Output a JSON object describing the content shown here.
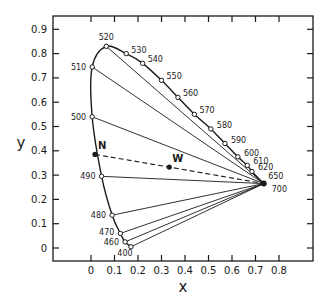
{
  "chart_data": {
    "type": "scatter",
    "title": "",
    "xlabel": "x",
    "ylabel": "y",
    "xlim": [
      -0.16,
      0.95
    ],
    "ylim": [
      -0.05,
      0.95
    ],
    "x_ticks": [
      "0",
      "0.1",
      "0.2",
      "0.3",
      "0.4",
      "0.5",
      "0.6",
      "0.7",
      "0.8"
    ],
    "y_ticks": [
      "0",
      "0.1",
      "0.2",
      "0.3",
      "0.4",
      "0.5",
      "0.6",
      "0.7",
      "0.8",
      "0.9"
    ],
    "grid": false,
    "spectral_locus": [
      {
        "label": "400",
        "x": 0.17,
        "y": 0.005
      },
      {
        "label": "460",
        "x": 0.145,
        "y": 0.025
      },
      {
        "label": "470",
        "x": 0.125,
        "y": 0.06
      },
      {
        "label": "480",
        "x": 0.09,
        "y": 0.135
      },
      {
        "label": "490",
        "x": 0.045,
        "y": 0.295
      },
      {
        "label": "500",
        "x": 0.005,
        "y": 0.54
      },
      {
        "label": "510",
        "x": 0.005,
        "y": 0.745
      },
      {
        "label": "520",
        "x": 0.065,
        "y": 0.83
      },
      {
        "label": "530",
        "x": 0.15,
        "y": 0.8
      },
      {
        "label": "540",
        "x": 0.22,
        "y": 0.76
      },
      {
        "label": "550",
        "x": 0.3,
        "y": 0.69
      },
      {
        "label": "560",
        "x": 0.37,
        "y": 0.62
      },
      {
        "label": "570",
        "x": 0.44,
        "y": 0.55
      },
      {
        "label": "580",
        "x": 0.51,
        "y": 0.49
      },
      {
        "label": "590",
        "x": 0.57,
        "y": 0.43
      },
      {
        "label": "600",
        "x": 0.625,
        "y": 0.375
      },
      {
        "label": "610",
        "x": 0.665,
        "y": 0.34
      },
      {
        "label": "620",
        "x": 0.685,
        "y": 0.315
      },
      {
        "label": "650",
        "x": 0.72,
        "y": 0.28
      },
      {
        "label": "700",
        "x": 0.735,
        "y": 0.265
      }
    ],
    "confusion_lines_from": "700",
    "confusion_lines_to": [
      "400",
      "460",
      "470",
      "480",
      "490",
      "500",
      "510",
      "520"
    ],
    "special_points": [
      {
        "label": "N",
        "x": 0.017,
        "y": 0.385
      },
      {
        "label": "W",
        "x": 0.333,
        "y": 0.333
      }
    ],
    "dashed_line": [
      "N",
      "W",
      "700"
    ]
  }
}
